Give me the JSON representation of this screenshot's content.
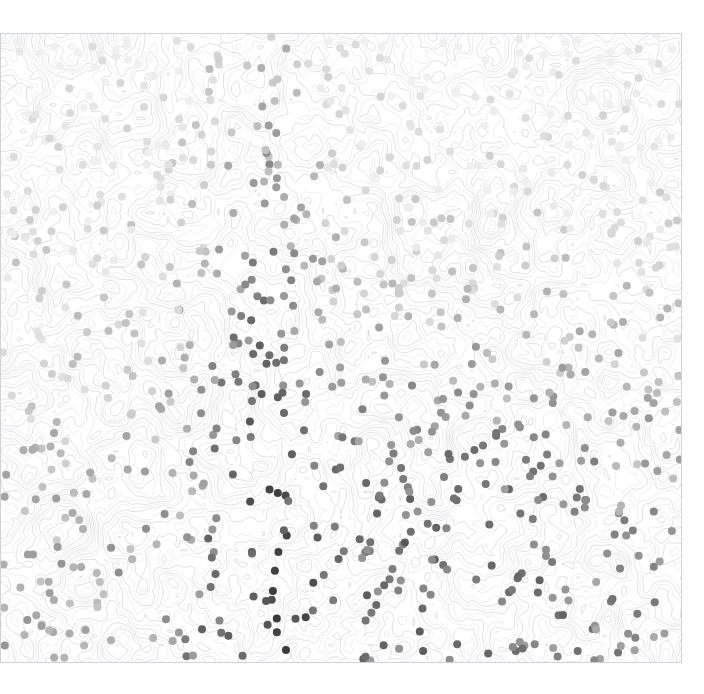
{
  "figure": {
    "title": "",
    "background_color": "#ffffff",
    "width": 704,
    "height": 694
  },
  "plot": {
    "x": 0,
    "y": 33,
    "width": 682,
    "height": 630,
    "frame_color": "#cfd2d6",
    "frame_visible": true
  },
  "chart_data": {
    "type": "scatter",
    "title": "",
    "subtitle": "",
    "xlabel": "",
    "ylabel": "",
    "xlim": [
      0,
      1
    ],
    "ylim": [
      0,
      1
    ],
    "xticks": [],
    "yticks": [],
    "xticklabels": [],
    "yticklabels": [],
    "grid": false,
    "legend": null,
    "legend_position": "none",
    "colormap": "greys",
    "colorbar": false,
    "marker": "circle",
    "marker_size_px": 8,
    "value_range": [
      0.0,
      1.0
    ],
    "color_stops": [
      "#f0f0f0",
      "#d9d9d9",
      "#bdbdbd",
      "#969696",
      "#737373",
      "#525252",
      "#333333"
    ],
    "overlay": {
      "type": "contour",
      "line_color": "#b9bcc2",
      "line_width": 0.6,
      "filled": false,
      "levels": 24
    },
    "point_count": 912,
    "value_field": "shade",
    "gradient_model": {
      "vertical_weight": 0.55,
      "band_center_x": 0.38,
      "band_width": 0.09,
      "band_weight": 0.42,
      "hotspot_center": [
        0.66,
        0.78
      ],
      "hotspot_radius": 0.3,
      "hotspot_weight": 0.38,
      "noise": 0.18
    }
  },
  "accessibility": {
    "role": "image",
    "label": "scatter plot with grey-scale shaded markers over contour background"
  }
}
